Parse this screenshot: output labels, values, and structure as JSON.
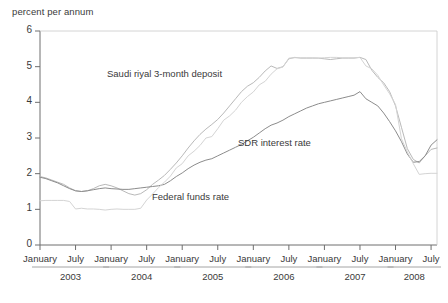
{
  "chart_data": {
    "type": "line",
    "title": "",
    "xlabel": "",
    "ylabel": "percent per annum",
    "ylim": [
      0,
      6
    ],
    "yticks": [
      0,
      1,
      2,
      3,
      4,
      5,
      6
    ],
    "grid": false,
    "legend_position": "inline-annotations",
    "x_axis": {
      "tick_labels": [
        "January",
        "July",
        "January",
        "July",
        "January",
        "July",
        "January",
        "July",
        "January",
        "July",
        "January",
        "July"
      ],
      "year_groups": [
        {
          "label": "2003",
          "months": [
            "January",
            "July"
          ]
        },
        {
          "label": "2004",
          "months": [
            "January",
            "July"
          ]
        },
        {
          "label": "2005",
          "months": [
            "January",
            "July"
          ]
        },
        {
          "label": "2006",
          "months": [
            "January",
            "July"
          ]
        },
        {
          "label": "2007",
          "months": [
            "January",
            "July"
          ]
        },
        {
          "label": "2008",
          "months": [
            "January",
            "July"
          ]
        }
      ]
    },
    "x": [
      "2003-01",
      "2003-02",
      "2003-03",
      "2003-04",
      "2003-05",
      "2003-06",
      "2003-07",
      "2003-08",
      "2003-09",
      "2003-10",
      "2003-11",
      "2003-12",
      "2004-01",
      "2004-02",
      "2004-03",
      "2004-04",
      "2004-05",
      "2004-06",
      "2004-07",
      "2004-08",
      "2004-09",
      "2004-10",
      "2004-11",
      "2004-12",
      "2005-01",
      "2005-02",
      "2005-03",
      "2005-04",
      "2005-05",
      "2005-06",
      "2005-07",
      "2005-08",
      "2005-09",
      "2005-10",
      "2005-11",
      "2005-12",
      "2006-01",
      "2006-02",
      "2006-03",
      "2006-04",
      "2006-05",
      "2006-06",
      "2006-07",
      "2006-08",
      "2006-09",
      "2006-10",
      "2006-11",
      "2006-12",
      "2007-01",
      "2007-02",
      "2007-03",
      "2007-04",
      "2007-05",
      "2007-06",
      "2007-07",
      "2007-08",
      "2007-09",
      "2007-10",
      "2007-11",
      "2007-12",
      "2008-01",
      "2008-02",
      "2008-03",
      "2008-04",
      "2008-05",
      "2008-06",
      "2008-07",
      "2008-08"
    ],
    "series": [
      {
        "name": "Saudi riyal 3-month deposit",
        "color": "#b9b9b9",
        "values": [
          1.92,
          1.88,
          1.82,
          1.76,
          1.7,
          1.6,
          1.52,
          1.5,
          1.52,
          1.58,
          1.66,
          1.7,
          1.66,
          1.6,
          1.52,
          1.44,
          1.4,
          1.44,
          1.55,
          1.7,
          1.82,
          1.95,
          2.12,
          2.3,
          2.5,
          2.72,
          2.92,
          3.1,
          3.25,
          3.38,
          3.52,
          3.7,
          3.9,
          4.1,
          4.3,
          4.45,
          4.55,
          4.7,
          4.88,
          5.02,
          4.95,
          5.0,
          5.22,
          5.26,
          5.24,
          5.24,
          5.24,
          5.24,
          5.22,
          5.2,
          5.22,
          5.24,
          5.24,
          5.24,
          5.26,
          5.2,
          4.9,
          4.7,
          4.55,
          4.3,
          3.9,
          3.3,
          2.7,
          2.4,
          2.3,
          2.5,
          2.68,
          2.72
        ]
      },
      {
        "name": "SDR interest rate",
        "color": "#8c8c8c",
        "values": [
          1.9,
          1.86,
          1.8,
          1.74,
          1.66,
          1.58,
          1.52,
          1.5,
          1.52,
          1.55,
          1.58,
          1.6,
          1.58,
          1.57,
          1.56,
          1.56,
          1.58,
          1.6,
          1.62,
          1.64,
          1.66,
          1.7,
          1.8,
          1.92,
          2.02,
          2.14,
          2.24,
          2.32,
          2.38,
          2.42,
          2.5,
          2.58,
          2.66,
          2.74,
          2.82,
          2.92,
          3.02,
          3.14,
          3.26,
          3.36,
          3.42,
          3.5,
          3.6,
          3.68,
          3.76,
          3.84,
          3.9,
          3.96,
          4.0,
          4.04,
          4.08,
          4.12,
          4.16,
          4.2,
          4.3,
          4.1,
          4.0,
          3.9,
          3.7,
          3.46,
          3.2,
          2.9,
          2.55,
          2.32,
          2.34,
          2.5,
          2.8,
          2.95
        ]
      },
      {
        "name": "Federal funds rate",
        "color": "#d4d4d4",
        "values": [
          1.24,
          1.25,
          1.25,
          1.25,
          1.25,
          1.22,
          1.01,
          1.03,
          1.01,
          1.01,
          1.0,
          0.98,
          1.0,
          1.01,
          1.0,
          1.0,
          1.0,
          1.03,
          1.26,
          1.43,
          1.61,
          1.76,
          1.93,
          2.16,
          2.28,
          2.5,
          2.63,
          2.79,
          3.0,
          3.04,
          3.26,
          3.5,
          3.62,
          3.78,
          4.0,
          4.16,
          4.29,
          4.49,
          4.59,
          4.79,
          4.94,
          4.99,
          5.24,
          5.25,
          5.25,
          5.25,
          5.25,
          5.24,
          5.25,
          5.26,
          5.26,
          5.25,
          5.25,
          5.25,
          5.26,
          5.02,
          4.94,
          4.76,
          4.49,
          4.24,
          3.94,
          2.98,
          2.61,
          2.28,
          1.98,
          2.0,
          2.01,
          2.01
        ]
      }
    ],
    "annotations": [
      {
        "text": "Saudi riyal 3-month deposit",
        "x_px": 107,
        "y_px": 68
      },
      {
        "text": "SDR interest rate",
        "x_px": 238,
        "y_px": 137
      },
      {
        "text": "Federal funds rate",
        "x_px": 152,
        "y_px": 191
      }
    ]
  }
}
